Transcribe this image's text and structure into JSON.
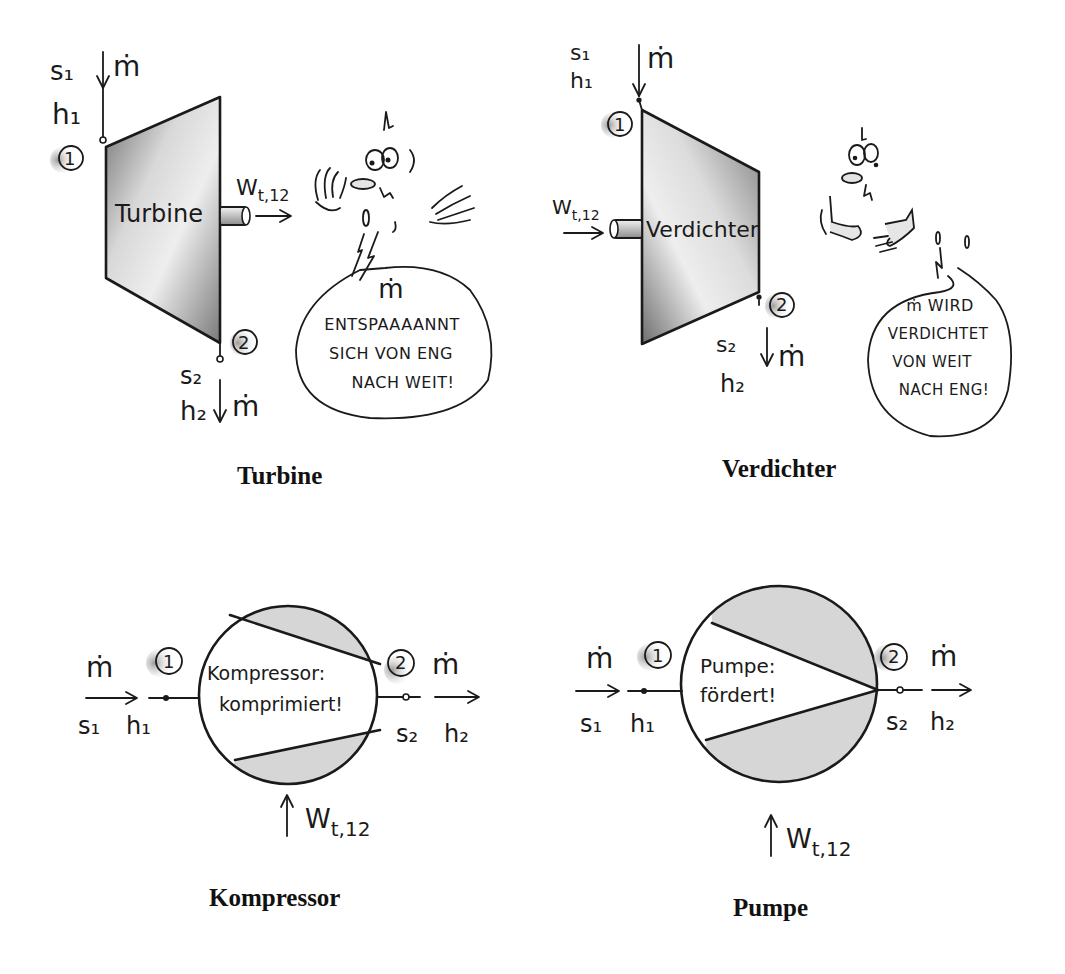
{
  "panels": {
    "turbine": {
      "caption": "Turbine",
      "body_label": "Turbine",
      "inlet": {
        "state": "1",
        "entropy": "s₁",
        "enthalpy": "h₁",
        "mass_flow": "ṁ"
      },
      "outlet": {
        "state": "2",
        "entropy": "s₂",
        "enthalpy": "h₂",
        "mass_flow": "ṁ"
      },
      "work": {
        "symbol": "W",
        "subscript": "t,12",
        "direction": "out"
      },
      "speech_bubble": {
        "lines": [
          "ṁ",
          "ENTSPAAAANNT",
          "SICH VON ENG",
          "NACH WEIT!"
        ]
      }
    },
    "verdichter": {
      "caption": "Verdichter",
      "body_label": "Verdichter",
      "inlet": {
        "state": "1",
        "entropy": "s₁",
        "enthalpy": "h₁",
        "mass_flow": "ṁ"
      },
      "outlet": {
        "state": "2",
        "entropy": "s₂",
        "enthalpy": "h₂",
        "mass_flow": "ṁ"
      },
      "work": {
        "symbol": "W",
        "subscript": "t,12",
        "direction": "in"
      },
      "speech_bubble": {
        "lines": [
          "ṁ WIRD",
          "VERDICHTET",
          "VON WEIT",
          "NACH ENG!"
        ]
      }
    },
    "kompressor": {
      "caption": "Kompressor",
      "body_label_lines": [
        "Kompressor:",
        "komprimiert!"
      ],
      "inlet": {
        "state": "1",
        "entropy": "s₁",
        "enthalpy": "h₁",
        "mass_flow": "ṁ"
      },
      "outlet": {
        "state": "2",
        "entropy": "s₂",
        "enthalpy": "h₂",
        "mass_flow": "ṁ"
      },
      "work": {
        "symbol": "W",
        "subscript": "t,12",
        "direction": "in"
      }
    },
    "pumpe": {
      "caption": "Pumpe",
      "body_label_lines": [
        "Pumpe:",
        "fördert!"
      ],
      "inlet": {
        "state": "1",
        "entropy": "s₁",
        "enthalpy": "h₁",
        "mass_flow": "ṁ"
      },
      "outlet": {
        "state": "2",
        "entropy": "s₂",
        "enthalpy": "h₂",
        "mass_flow": "ṁ"
      },
      "work": {
        "symbol": "W",
        "subscript": "t,12",
        "direction": "in"
      }
    }
  },
  "colors": {
    "ink": "#1a1a1a",
    "shade_dark": "#8a8a8a",
    "shade_light": "#e6e6e6",
    "background": "#ffffff"
  }
}
